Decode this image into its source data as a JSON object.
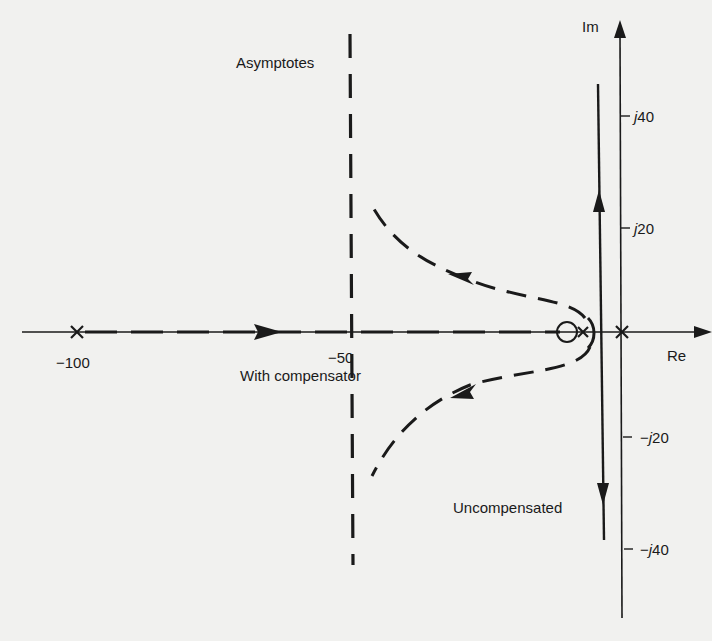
{
  "diagram": {
    "type": "root-locus",
    "axes": {
      "real_label": "Re",
      "imag_label": "Im"
    },
    "real_ticks": [
      {
        "value": -100,
        "label": "−100"
      },
      {
        "value": -50,
        "label": "−50"
      }
    ],
    "imag_ticks": [
      {
        "value": 40,
        "prefix": "",
        "j": "j",
        "num": "40"
      },
      {
        "value": 20,
        "prefix": "",
        "j": "j",
        "num": "20"
      },
      {
        "value": -20,
        "prefix": "−",
        "j": "j",
        "num": "20"
      },
      {
        "value": -40,
        "prefix": "−",
        "j": "j",
        "num": "40"
      }
    ],
    "annotations": {
      "asymptotes": "Asymptotes",
      "with_compensator": "With compensator",
      "uncompensated": "Uncompensated"
    },
    "poles": [
      -100,
      -10,
      0
    ],
    "zeros": [
      -13
    ],
    "asymptote_real": -50,
    "colors": {
      "background": "#f1f1ef",
      "ink": "#1a1a1a"
    }
  }
}
